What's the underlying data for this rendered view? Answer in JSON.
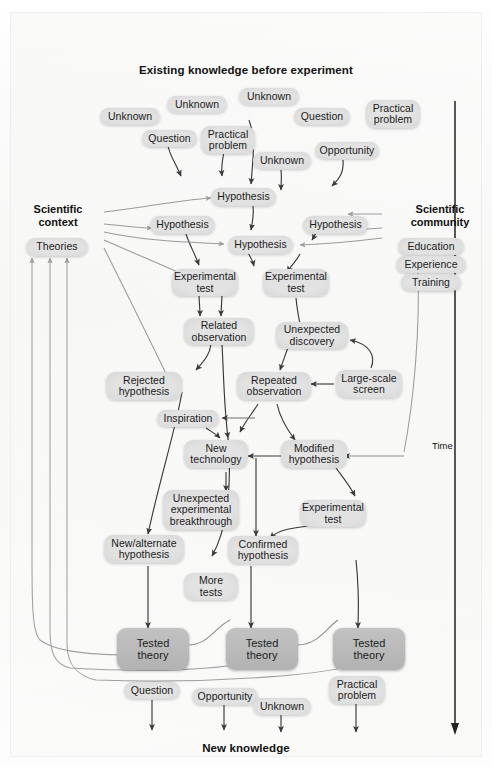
{
  "figure": {
    "title": "Existing knowledge before experiment",
    "footer": "New knowledge",
    "time_axis_label": "Time"
  },
  "side_headings": {
    "left": "Scientific\ncontext",
    "right": "Scientific\ncommunity"
  },
  "left_attributes": [
    "Theories"
  ],
  "right_attributes": [
    "Education",
    "Experience",
    "Training"
  ],
  "top_inputs": [
    {
      "label": "Unknown"
    },
    {
      "label": "Unknown"
    },
    {
      "label": "Unknown"
    },
    {
      "label": "Question"
    },
    {
      "label": "Practical\nproblem"
    },
    {
      "label": "Question"
    },
    {
      "label": "Practical\nproblem"
    },
    {
      "label": "Question"
    },
    {
      "label": "Unknown"
    },
    {
      "label": "Unknown"
    },
    {
      "label": "Opportunity"
    }
  ],
  "process_nodes": [
    {
      "label": "Hypothesis"
    },
    {
      "label": "Hypothesis"
    },
    {
      "label": "Hypothesis"
    },
    {
      "label": "Hypothesis"
    },
    {
      "label": "Experimental\ntest"
    },
    {
      "label": "Experimental\ntest"
    },
    {
      "label": "Related\nobservation"
    },
    {
      "label": "Unexpected\ndiscovery"
    },
    {
      "label": "Rejected\nhypothesis"
    },
    {
      "label": "Repeated\nobservation"
    },
    {
      "label": "Large-scale\nscreen"
    },
    {
      "label": "Inspiration"
    },
    {
      "label": "New\ntechnology"
    },
    {
      "label": "Modified\nhypothesis"
    },
    {
      "label": "Unexpected\nexperimental\nbreakthrough"
    },
    {
      "label": "Experimental\ntest"
    },
    {
      "label": "New/alternate\nhypothesis"
    },
    {
      "label": "Confirmed\nhypothesis"
    },
    {
      "label": "More\ntests"
    }
  ],
  "outcomes": [
    {
      "label": "Tested\ntheory"
    },
    {
      "label": "Tested\ntheory"
    },
    {
      "label": "Tested\ntheory"
    }
  ],
  "bottom_outputs": [
    {
      "label": "Question"
    },
    {
      "label": "Opportunity"
    },
    {
      "label": "Unknown"
    },
    {
      "label": "Practical\nproblem"
    }
  ],
  "colors": {
    "node_fill": "#dedede",
    "outcome_fill": "#b8b8b8",
    "text": "#111111",
    "wire": "#3a3a3a",
    "wire_light": "#9b9b9b",
    "background": "#f8f8f7"
  }
}
